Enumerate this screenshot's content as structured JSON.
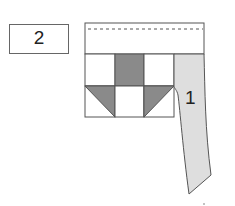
{
  "diagram": {
    "type": "quilt-assembly",
    "step_label": "2",
    "strip_label": "1",
    "colors": {
      "dark_fabric": "#8a8a8a",
      "strip_fabric": "#dedede",
      "outline": "#555555",
      "background": "#ffffff"
    },
    "block": {
      "rows": 2,
      "cols": 3,
      "cells": [
        [
          "light",
          "dark",
          "light"
        ],
        [
          "half-triangle-dark-top-right",
          "light",
          "half-triangle-dark-top-left"
        ]
      ]
    },
    "top_border": {
      "seam_line": "dashed"
    }
  }
}
